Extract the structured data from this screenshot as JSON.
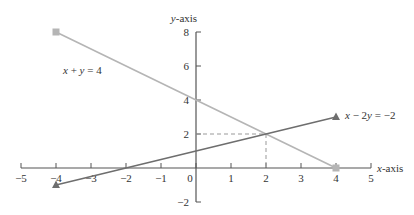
{
  "chart_data": {
    "type": "line",
    "title": "",
    "xlabel": "x-axis",
    "ylabel": "y-axis",
    "xlim": [
      -5,
      5
    ],
    "ylim": [
      -2,
      8
    ],
    "x_ticks": [
      -5,
      -4,
      -3,
      -2,
      -1,
      0,
      1,
      2,
      3,
      4,
      5
    ],
    "y_ticks": [
      -2,
      2,
      4,
      6,
      8
    ],
    "grid": false,
    "series": [
      {
        "name": "x + y = 4",
        "color": "#b5b5b5",
        "marker": "square",
        "points": [
          [
            -4,
            8
          ],
          [
            4,
            0
          ]
        ]
      },
      {
        "name": "x − 2y = −2",
        "color": "#6e6e6e",
        "marker": "triangle",
        "points": [
          [
            -4,
            -1
          ],
          [
            4,
            3
          ]
        ]
      }
    ],
    "annotations": [
      {
        "type": "intersection",
        "point": [
          2,
          2
        ],
        "guides": "dashed"
      }
    ]
  },
  "labels": {
    "x_axis": "x-axis",
    "y_axis": "y-axis",
    "eq1": "x + y = 4",
    "eq2": "x − 2y = −2"
  }
}
